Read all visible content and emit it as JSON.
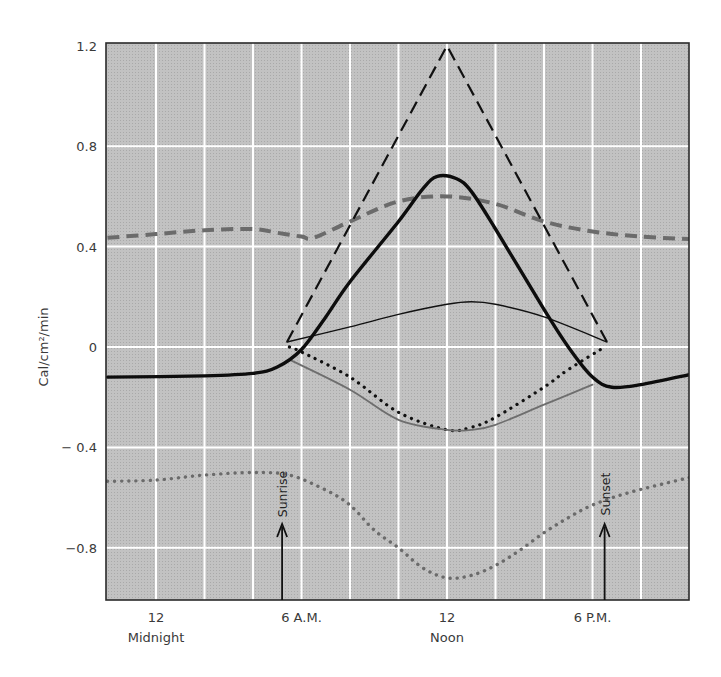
{
  "chart_data": {
    "type": "line",
    "title": "",
    "xlabel": "",
    "ylabel": "Cal/cm²/min",
    "xlim": [
      -2,
      22
    ],
    "ylim": [
      -1.02,
      1.2
    ],
    "grid": true,
    "x_unit": "hours after midnight",
    "x_grid_step": 2,
    "y_ticks": [
      {
        "value": 1.2,
        "label": "1.2"
      },
      {
        "value": 0.8,
        "label": "0.8"
      },
      {
        "value": 0.4,
        "label": "0.4"
      },
      {
        "value": 0,
        "label": "0"
      },
      {
        "value": -0.4,
        "label": "− 0.4"
      },
      {
        "value": -0.8,
        "label": "−0.8"
      }
    ],
    "x_ticks": [
      {
        "value": 0,
        "label": "12",
        "sublabel": "Midnight"
      },
      {
        "value": 6,
        "label": "6 A.M.",
        "sublabel": ""
      },
      {
        "value": 12,
        "label": "12",
        "sublabel": "Noon"
      },
      {
        "value": 18,
        "label": "6 P.M.",
        "sublabel": ""
      }
    ],
    "annotations": [
      {
        "label": "Sunrise",
        "x": 5.2,
        "arrow": true
      },
      {
        "label": "Sunset",
        "x": 18.5,
        "arrow": true
      }
    ],
    "series": [
      {
        "name": "gray-dashed",
        "style": "dashed",
        "color": "#6b6b6b",
        "width": 4,
        "x": [
          -2,
          0,
          2,
          4,
          5,
          6,
          6.5,
          8,
          10,
          12,
          14,
          16,
          18,
          20,
          22
        ],
        "y": [
          0.435,
          0.45,
          0.465,
          0.47,
          0.455,
          0.44,
          0.435,
          0.5,
          0.58,
          0.6,
          0.57,
          0.5,
          0.46,
          0.44,
          0.43
        ]
      },
      {
        "name": "black-dashed",
        "style": "dashed",
        "color": "#111111",
        "width": 2.2,
        "x": [
          5.4,
          12,
          18.6
        ],
        "y": [
          0.02,
          1.2,
          0.02
        ]
      },
      {
        "name": "black-thin-solid",
        "style": "solid",
        "color": "#111111",
        "width": 1.4,
        "x": [
          5.4,
          8,
          10,
          12,
          13,
          14,
          16,
          18.6
        ],
        "y": [
          0.02,
          0.08,
          0.13,
          0.17,
          0.18,
          0.17,
          0.12,
          0.02
        ]
      },
      {
        "name": "black-dotted",
        "style": "dotted",
        "color": "#111111",
        "width": 3.2,
        "x": [
          5.5,
          6,
          8,
          10,
          12,
          13,
          14,
          16,
          17,
          18.5
        ],
        "y": [
          0,
          -0.02,
          -0.12,
          -0.26,
          -0.33,
          -0.32,
          -0.28,
          -0.16,
          -0.09,
          0
        ]
      },
      {
        "name": "gray-thin-solid",
        "style": "solid",
        "color": "#6e6e6e",
        "width": 1.8,
        "x": [
          5.5,
          8,
          10,
          12,
          13,
          14,
          16,
          18
        ],
        "y": [
          -0.05,
          -0.17,
          -0.29,
          -0.33,
          -0.33,
          -0.31,
          -0.23,
          -0.15
        ]
      },
      {
        "name": "gray-dotted",
        "style": "dotted",
        "color": "#6b6b6b",
        "width": 3.4,
        "x": [
          -2,
          0,
          2,
          4,
          5.5,
          7,
          8,
          9,
          10,
          11,
          12,
          13,
          14,
          15,
          16,
          17,
          18,
          19.5,
          22
        ],
        "y": [
          -0.535,
          -0.53,
          -0.51,
          -0.5,
          -0.51,
          -0.57,
          -0.63,
          -0.73,
          -0.8,
          -0.88,
          -0.92,
          -0.91,
          -0.87,
          -0.81,
          -0.74,
          -0.68,
          -0.63,
          -0.58,
          -0.52
        ]
      },
      {
        "name": "black-thick-solid",
        "style": "solid",
        "color": "#0d0d0d",
        "width": 3.4,
        "x": [
          -2,
          2,
          4,
          5,
          6,
          7,
          8,
          10,
          11,
          11.6,
          12.4,
          13,
          14,
          16,
          17,
          18,
          18.8,
          20,
          22
        ],
        "y": [
          -0.12,
          -0.115,
          -0.105,
          -0.08,
          -0.01,
          0.12,
          0.26,
          0.5,
          0.63,
          0.68,
          0.67,
          0.62,
          0.47,
          0.15,
          0,
          -0.12,
          -0.16,
          -0.15,
          -0.11
        ]
      }
    ]
  },
  "colors": {
    "plot_background": "#bdbdbd",
    "grid": "#ffffff",
    "frame": "#2a2a2a"
  }
}
